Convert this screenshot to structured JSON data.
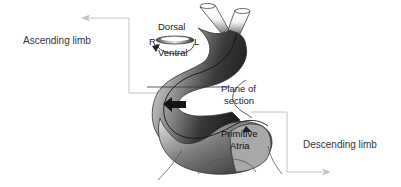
{
  "diagram": {
    "labels": {
      "ascending_limb": "Ascending limb",
      "descending_limb": "Descending limb",
      "dorsal": "Dorsal",
      "ventral": "Ventral",
      "right": "R",
      "left": "L",
      "plane_of_section_line1": "Plane of",
      "plane_of_section_line2": "section",
      "primitive_atria_line1": "Primitive",
      "primitive_atria_line2": "Atria"
    },
    "colors": {
      "leader_lines": "#bbbbbb",
      "text": "#333333",
      "tube_dark": "#2a2a2a",
      "tube_light": "#d8d8d8",
      "atria_fill": "#a8a8a8"
    }
  }
}
